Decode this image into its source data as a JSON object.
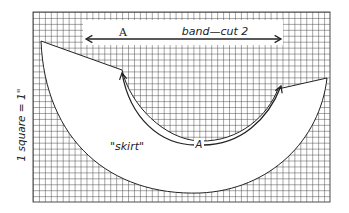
{
  "figure": {
    "scale_label": "1 square = 1\"",
    "band": {
      "marker": "A",
      "label": "band—cut 2"
    },
    "skirt": {
      "label": "\"skirt\"",
      "seam_marker": "A"
    },
    "colors": {
      "grid_line": "#3a3a3a",
      "outline": "#222222",
      "fill": "#ffffff",
      "text": "#222222"
    },
    "grid": {
      "x0": 33,
      "y0": 12,
      "x1": 330,
      "y1": 202,
      "cell": 5.94
    }
  }
}
